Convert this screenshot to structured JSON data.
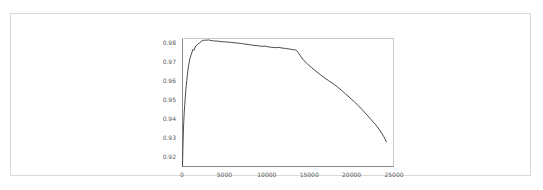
{
  "figure": {
    "background_color": "#ffffff",
    "border_color": "#d9d9d9",
    "line_color": "#4a4a4a",
    "axis_color": "#5a5a5a",
    "tick_label_color": "#5a5a5a"
  },
  "chart_data": {
    "type": "line",
    "title": "",
    "subtitle": "",
    "xlabel": "",
    "ylabel": "",
    "xlim": [
      0,
      25000
    ],
    "ylim": [
      0.9145,
      0.9825
    ],
    "grid": false,
    "legend": null,
    "legend_position": "none",
    "xticks": [
      0,
      5000,
      10000,
      15000,
      20000,
      25000
    ],
    "xtick_labels": [
      "0",
      "5000",
      "10000",
      "15000",
      "20000",
      "25000"
    ],
    "yticks": [
      0.92,
      0.93,
      0.94,
      0.95,
      0.96,
      0.97,
      0.98
    ],
    "ytick_labels": [
      "0.92",
      "0.93",
      "0.94",
      "0.95",
      "0.96",
      "0.97",
      "0.98"
    ],
    "annotations": [],
    "series": [
      {
        "name": "accuracy",
        "color": "#4a4a4a",
        "linewidth": 1,
        "x": [
          60,
          110,
          160,
          210,
          260,
          320,
          380,
          440,
          500,
          560,
          620,
          700,
          780,
          860,
          940,
          1020,
          1100,
          1200,
          1300,
          1400,
          1500,
          1650,
          1800,
          1950,
          2100,
          2300,
          2500,
          2700,
          2900,
          3100,
          3400,
          3700,
          4000,
          4300,
          4600,
          5000,
          5400,
          5800,
          6200,
          6600,
          7000,
          7400,
          7800,
          8200,
          8600,
          9000,
          9400,
          9800,
          10200,
          10600,
          11000,
          11400,
          11800,
          12200,
          12500,
          12800,
          13000,
          13200,
          13400,
          13600,
          13900,
          14300,
          14800,
          15300,
          15800,
          16300,
          16800,
          17300,
          17800,
          18300,
          18800,
          19300,
          19800,
          20300,
          20800,
          21300,
          21800,
          22300,
          22800,
          23300,
          23800,
          24100
        ],
        "y": [
          0.915,
          0.9255,
          0.933,
          0.9385,
          0.943,
          0.947,
          0.951,
          0.9545,
          0.9575,
          0.96,
          0.9625,
          0.9655,
          0.968,
          0.97,
          0.9718,
          0.973,
          0.974,
          0.9752,
          0.9765,
          0.976,
          0.9772,
          0.9785,
          0.979,
          0.9796,
          0.98,
          0.9808,
          0.9812,
          0.9814,
          0.9813,
          0.9815,
          0.9812,
          0.981,
          0.9809,
          0.9808,
          0.9806,
          0.9805,
          0.9803,
          0.9802,
          0.98,
          0.9798,
          0.9796,
          0.9793,
          0.9791,
          0.9788,
          0.9786,
          0.9784,
          0.9781,
          0.9782,
          0.9778,
          0.9776,
          0.9774,
          0.9776,
          0.9772,
          0.977,
          0.9768,
          0.9766,
          0.9764,
          0.9763,
          0.9762,
          0.9755,
          0.9735,
          0.971,
          0.9688,
          0.9668,
          0.965,
          0.9632,
          0.9615,
          0.96,
          0.9585,
          0.9568,
          0.955,
          0.953,
          0.951,
          0.949,
          0.9468,
          0.9445,
          0.942,
          0.9395,
          0.937,
          0.934,
          0.9305,
          0.9278
        ]
      }
    ]
  }
}
